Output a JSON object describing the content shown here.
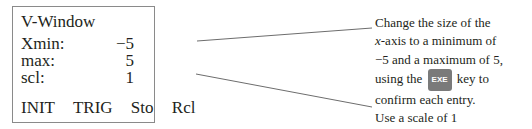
{
  "screen": {
    "title": "V-Window",
    "rows": [
      {
        "label": "Xmin:",
        "value": "−5"
      },
      {
        "label": "max:",
        "value": "5"
      },
      {
        "label": "scl:",
        "value": "1"
      }
    ],
    "menu": [
      "INIT",
      "TRIG",
      "Sto",
      "Rcl"
    ]
  },
  "annotation": {
    "line1": "Change the size of the",
    "line2_var": "x",
    "line2_rest": "-axis to a minimum of",
    "line3": "−5 and a maximum of 5,",
    "line4_pre": "using the",
    "key_label": "EXE",
    "line4_post": "key to",
    "line5": "confirm each entry.",
    "line6": "Use a scale of 1"
  }
}
